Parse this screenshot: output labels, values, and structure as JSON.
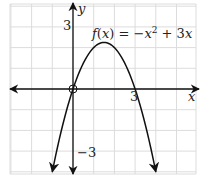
{
  "chart_data": {
    "type": "line",
    "title": "",
    "function_label": "f(x) = −x² + 3x",
    "function_label_parts": {
      "f": "f",
      "open": "(",
      "x": "x",
      "close": ")",
      "eq": " = −",
      "x2": "x",
      "exp": "2",
      "plus": " + 3",
      "x3": "x"
    },
    "xlabel": "x",
    "ylabel": "y",
    "xlim": [
      -3,
      6
    ],
    "ylim": [
      -4.1,
      4.1
    ],
    "grid": true,
    "x_tick_labels": [
      {
        "value": 3,
        "label": "3"
      }
    ],
    "y_tick_labels": [
      {
        "value": 3,
        "label": "3"
      },
      {
        "value": -3,
        "label": "−3"
      }
    ],
    "series": [
      {
        "name": "f(x) = −x² + 3x",
        "x": [
          -1,
          -0.5,
          0,
          0.5,
          1,
          1.5,
          2,
          2.5,
          3,
          3.5,
          4
        ],
        "y": [
          -4,
          -1.75,
          0,
          1.25,
          2,
          2.25,
          2,
          1.25,
          0,
          -1.75,
          -4
        ],
        "arrows_at_ends": true
      }
    ],
    "annotations": [
      {
        "type": "open-circle",
        "x": 0,
        "y": 0
      }
    ]
  },
  "labels": {
    "y_axis": "y",
    "x_axis": "x",
    "tick_x_3": "3",
    "tick_y_3": "3",
    "tick_y_neg3": "−3"
  }
}
